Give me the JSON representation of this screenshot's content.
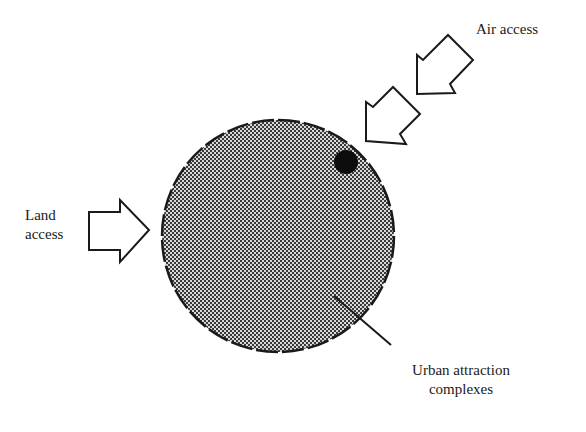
{
  "diagram": {
    "type": "conceptual-map",
    "colors": {
      "background": "#ffffff",
      "stroke": "#1a1a1a",
      "circle_fill_dark": "#3a3a3a",
      "circle_fill_light": "#d8d8d8",
      "dot": "#0d0d0d"
    },
    "urban_area": {
      "shape": "circle",
      "outline": "dashed",
      "fill": "checkered-halftone",
      "center": [
        278,
        236
      ],
      "radius": 116
    },
    "attraction_dot": {
      "shape": "filled-circle",
      "center": [
        346,
        162
      ],
      "radius": 12
    },
    "labels": {
      "land_access": [
        "Land",
        "access"
      ],
      "air_access": "Air access",
      "urban_attraction": [
        "Urban attraction",
        "complexes"
      ]
    },
    "arrows": [
      {
        "name": "land-access-arrow",
        "direction": "right",
        "style": "hollow-block"
      },
      {
        "name": "air-access-arrow-upper",
        "direction": "down-left",
        "style": "hollow-block"
      },
      {
        "name": "air-access-arrow-lower",
        "direction": "down-left",
        "style": "hollow-block"
      }
    ],
    "leader_line": {
      "from": [
        334,
        296
      ],
      "to": [
        391,
        345
      ]
    }
  }
}
